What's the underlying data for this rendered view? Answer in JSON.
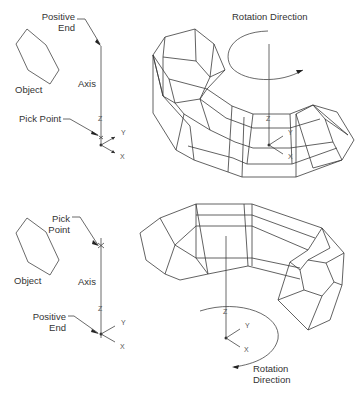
{
  "figure": {
    "top_panel": {
      "labels": {
        "positive_end_1": "Positive",
        "positive_end_2": "End",
        "object": "Object",
        "axis": "Axis",
        "pick_point": "Pick Point",
        "rotation_direction": "Rotation Direction"
      },
      "ucs": {
        "z": "Z",
        "y": "Y",
        "x": "X"
      },
      "ucs_right": {
        "z": "Z",
        "y": "Y",
        "x": "X"
      }
    },
    "bottom_panel": {
      "labels": {
        "pick_point_1": "Pick",
        "pick_point_2": "Point",
        "object": "Object",
        "axis": "Axis",
        "positive_end_1": "Positive",
        "positive_end_2": "End",
        "rotation_direction_1": "Rotation",
        "rotation_direction_2": "Direction"
      },
      "ucs": {
        "z": "Z",
        "y": "Y",
        "x": "X"
      },
      "ucs_right": {
        "z": "Z",
        "y": "Y",
        "x": "X"
      }
    },
    "colors": {
      "line": "#3a3a3a",
      "text": "#333333",
      "background": "#ffffff"
    }
  }
}
